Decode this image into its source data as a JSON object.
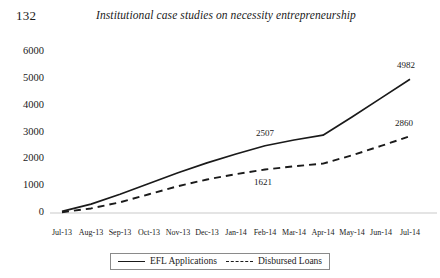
{
  "page": {
    "folio": "132",
    "running_head": "Institutional case studies on necessity entrepreneurship"
  },
  "chart_data": {
    "type": "line",
    "title": "",
    "xlabel": "",
    "ylabel": "",
    "ylim": [
      0,
      6000
    ],
    "yticks": [
      0,
      1000,
      2000,
      3000,
      4000,
      5000,
      6000
    ],
    "ytick_labels": [
      "0",
      "1000",
      "2000",
      "3000",
      "4000",
      "5000",
      "6000"
    ],
    "grid": false,
    "legend_position": "bottom-center",
    "categories": [
      "Jul-13",
      "Aug-13",
      "Sep-13",
      "Oct-13",
      "Nov-13",
      "Dec-13",
      "Jan-14",
      "Feb-14",
      "Mar-14",
      "Apr-14",
      "May-14",
      "Jun-14",
      "Jul-14"
    ],
    "series": [
      {
        "name": "EFL Applications",
        "style": "solid",
        "color": "#1a1a1a",
        "values": [
          60,
          330,
          700,
          1100,
          1500,
          1870,
          2200,
          2507,
          2720,
          2900,
          3580,
          4280,
          4982
        ]
      },
      {
        "name": "Disbursed Loans",
        "style": "dashed",
        "color": "#1a1a1a",
        "values": [
          30,
          170,
          400,
          700,
          1000,
          1250,
          1450,
          1621,
          1740,
          1840,
          2150,
          2500,
          2860
        ]
      }
    ],
    "annotations": [
      {
        "text": "2507",
        "series": "EFL Applications",
        "category": "Feb-14",
        "value": 2507
      },
      {
        "text": "1621",
        "series": "Disbursed Loans",
        "category": "Feb-14",
        "value": 1621
      },
      {
        "text": "4982",
        "series": "EFL Applications",
        "category": "Jul-14",
        "value": 4982
      },
      {
        "text": "2860",
        "series": "Disbursed Loans",
        "category": "Jul-14",
        "value": 2860
      }
    ],
    "legend": [
      {
        "label": "EFL Applications",
        "style": "solid"
      },
      {
        "label": "Disbursed Loans",
        "style": "dashed"
      }
    ]
  }
}
